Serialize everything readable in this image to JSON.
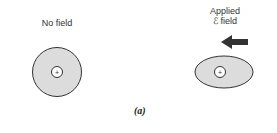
{
  "panel_a": {
    "left_label": "No field",
    "right_label_line1": "Applied",
    "right_label_line2": "ℰ field",
    "nucleus_symbol": "+",
    "caption": "(a)"
  },
  "colors": {
    "cloud_fill": "#dcdcdc",
    "outline": "#333333",
    "arrow": "#333333"
  }
}
